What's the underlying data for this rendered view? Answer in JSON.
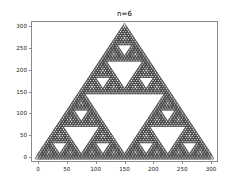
{
  "chart_data": {
    "type": "scatter",
    "title": "n=6",
    "xlabel": "",
    "ylabel": "",
    "xlim": [
      -12,
      312
    ],
    "ylim": [
      -12,
      312
    ],
    "grid": false,
    "legend": null,
    "marker": {
      "shape": "triangle-up",
      "edge_color": "#3f3f3f",
      "face_color": "#f2f2f2",
      "size_px": 3.1
    },
    "recursion_depth": 6,
    "outer_triangle_vertices": [
      [
        0,
        0
      ],
      [
        300,
        0
      ],
      [
        150,
        300
      ]
    ],
    "xticks": [
      0,
      50,
      100,
      150,
      200,
      250,
      300
    ],
    "yticks": [
      0,
      50,
      100,
      150,
      200,
      250,
      300
    ],
    "xtick_labels": [
      "0",
      "50",
      "100",
      "150",
      "200",
      "250",
      "300"
    ],
    "ytick_labels": [
      "0",
      "50",
      "100",
      "150",
      "200",
      "250",
      "300"
    ]
  },
  "figure": {
    "background_color": "#ffffff",
    "axes_edge_color": "#8a8a8a"
  }
}
